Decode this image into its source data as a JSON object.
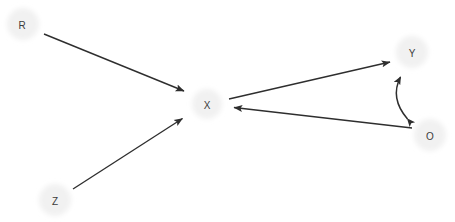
{
  "diagram": {
    "type": "directed-graph",
    "background_color": "#ffffff",
    "node_fill_color": "#f1f1f1",
    "node_label_color": "#3c3c3c",
    "edge_color": "#2e2e2e",
    "nodes": [
      {
        "id": "R",
        "label": "R",
        "cx": 23,
        "cy": 24,
        "r": 18
      },
      {
        "id": "Z",
        "label": "Z",
        "cx": 55,
        "cy": 200,
        "r": 18
      },
      {
        "id": "X",
        "label": "X",
        "cx": 207,
        "cy": 104,
        "r": 17
      },
      {
        "id": "Y",
        "label": "Y",
        "cx": 412,
        "cy": 52,
        "r": 18
      },
      {
        "id": "O",
        "label": "O",
        "cx": 430,
        "cy": 135,
        "r": 18
      }
    ],
    "edges": [
      {
        "from": "R",
        "to": "X",
        "style": "straight",
        "arrow": "single",
        "x1": 44,
        "y1": 34,
        "x2": 186,
        "y2": 92
      },
      {
        "from": "Z",
        "to": "X",
        "style": "straight",
        "arrow": "single",
        "x1": 73,
        "y1": 189,
        "x2": 184,
        "y2": 117
      },
      {
        "from": "X",
        "to": "Y",
        "style": "straight",
        "arrow": "single",
        "x1": 229,
        "y1": 99,
        "x2": 392,
        "y2": 61
      },
      {
        "from": "O",
        "to": "X",
        "style": "straight",
        "arrow": "single",
        "x1": 412,
        "y1": 128,
        "x2": 232,
        "y2": 107
      },
      {
        "from": "Y",
        "to": "O",
        "style": "curved",
        "arrow": "double",
        "x1": 399,
        "y1": 74,
        "cx": 390,
        "cy": 98,
        "x2": 409,
        "y2": 120
      }
    ]
  }
}
